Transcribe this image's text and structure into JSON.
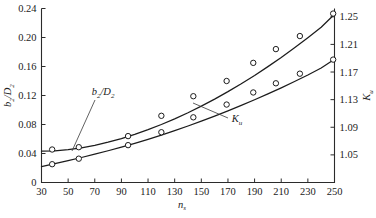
{
  "chart_data": {
    "type": "line",
    "title": "",
    "xlabel": "n_s",
    "xlabel_base": "n",
    "xlabel_sub": "s",
    "ylabel_left": "b2/D2",
    "ylabel_left_parts": [
      "b",
      "2",
      "/D",
      "2"
    ],
    "ylabel_right": "K_u",
    "ylabel_right_base": "K",
    "ylabel_right_sub": "u",
    "xlim": [
      30,
      250
    ],
    "xticks": [
      30,
      50,
      70,
      90,
      110,
      130,
      150,
      170,
      190,
      210,
      230,
      250
    ],
    "xtick_labels": [
      "30",
      "50",
      "70",
      "90",
      "110",
      "130",
      "150",
      "170",
      "190",
      "210",
      "230",
      "250"
    ],
    "ylim_left": [
      0,
      0.24
    ],
    "yticks_left": [
      0,
      0.04,
      0.08,
      0.12,
      0.16,
      0.2,
      0.24
    ],
    "ytick_labels_left": [
      "0",
      "0.04",
      "0.08",
      "0.12",
      "0.16",
      "0.20",
      "0.24"
    ],
    "ylim_right": [
      1.01,
      1.262
    ],
    "yticks_right": [
      1.05,
      1.09,
      1.13,
      1.17,
      1.21,
      1.25
    ],
    "ytick_labels_right": [
      "1.05",
      "1.09",
      "1.13",
      "1.17",
      "1.21",
      "1.25"
    ],
    "grid": false,
    "legend": "annotations-inline",
    "annotations": [
      {
        "name": "b2/D2",
        "label_x": 103,
        "label_y": 95,
        "tip_x": 72,
        "tip_y": 151
      },
      {
        "name": "Ku",
        "label_x": 237,
        "label_y": 122,
        "tip_x": 193,
        "tip_y": 103
      }
    ],
    "series": [
      {
        "name": "b2/D2",
        "axis": "left",
        "marker": "open-circle",
        "curve": [
          [
            30,
            0.0432
          ],
          [
            40,
            0.0437
          ],
          [
            50,
            0.0452
          ],
          [
            60,
            0.0478
          ],
          [
            70,
            0.0513
          ],
          [
            80,
            0.0556
          ],
          [
            90,
            0.0606
          ],
          [
            100,
            0.0664
          ],
          [
            110,
            0.0729
          ],
          [
            120,
            0.08
          ],
          [
            130,
            0.0878
          ],
          [
            140,
            0.0962
          ],
          [
            150,
            0.1053
          ],
          [
            160,
            0.115
          ],
          [
            170,
            0.1253
          ],
          [
            180,
            0.1362
          ],
          [
            190,
            0.1477
          ],
          [
            200,
            0.1598
          ],
          [
            210,
            0.1725
          ],
          [
            220,
            0.1858
          ],
          [
            230,
            0.1997
          ],
          [
            240,
            0.2142
          ],
          [
            250,
            0.232
          ]
        ],
        "points": [
          [
            38,
            0.0455
          ],
          [
            58,
            0.0487
          ],
          [
            95,
            0.064
          ],
          [
            120,
            0.092
          ],
          [
            144,
            0.119
          ],
          [
            169,
            0.14
          ],
          [
            189,
            0.165
          ],
          [
            206,
            0.184
          ],
          [
            224,
            0.202
          ],
          [
            249,
            0.233
          ]
        ]
      },
      {
        "name": "Ku",
        "axis": "right",
        "marker": "open-circle",
        "curve": [
          [
            30,
            1.033
          ],
          [
            40,
            1.0372
          ],
          [
            50,
            1.0416
          ],
          [
            60,
            1.0462
          ],
          [
            70,
            1.051
          ],
          [
            80,
            1.056
          ],
          [
            90,
            1.0613
          ],
          [
            100,
            1.0668
          ],
          [
            110,
            1.0726
          ],
          [
            120,
            1.0787
          ],
          [
            130,
            1.0851
          ],
          [
            140,
            1.0918
          ],
          [
            150,
            1.0988
          ],
          [
            160,
            1.1061
          ],
          [
            170,
            1.1137
          ],
          [
            180,
            1.1216
          ],
          [
            190,
            1.1298
          ],
          [
            200,
            1.1383
          ],
          [
            210,
            1.1471
          ],
          [
            220,
            1.1562
          ],
          [
            230,
            1.1657
          ],
          [
            240,
            1.1758
          ],
          [
            250,
            1.1885
          ]
        ],
        "points": [
          [
            38,
            1.0365
          ],
          [
            58,
            1.0445
          ],
          [
            95,
            1.0641
          ],
          [
            120,
            1.0828
          ],
          [
            144,
            1.1044
          ],
          [
            169,
            1.1229
          ],
          [
            189,
            1.1404
          ],
          [
            206,
            1.1537
          ],
          [
            224,
            1.1676
          ],
          [
            249,
            1.188
          ]
        ]
      }
    ]
  }
}
